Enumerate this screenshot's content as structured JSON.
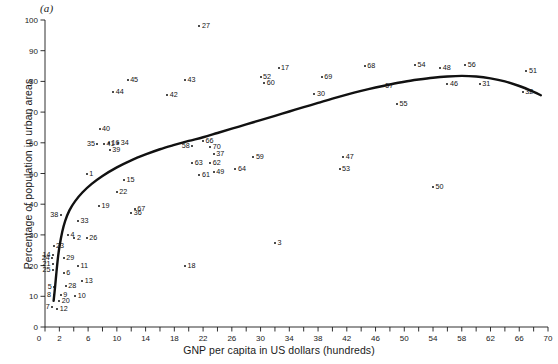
{
  "figure": {
    "panel_label": "(a)",
    "xlabel": "GNP per capita  in US dollars (hundreds)",
    "ylabel": "Percentage of population in urban areas"
  },
  "chart_data": {
    "type": "scatter",
    "title": "",
    "xlabel": "GNP per capita in US dollars (hundreds)",
    "ylabel": "Percentage of population in urban areas",
    "xlim": [
      0,
      70
    ],
    "ylim": [
      0,
      100
    ],
    "xticks": [
      0,
      2,
      6,
      10,
      14,
      18,
      22,
      26,
      30,
      34,
      38,
      42,
      46,
      50,
      54,
      58,
      62,
      66,
      70
    ],
    "xtick_labels": [
      "0",
      "2",
      "6",
      "10",
      "14",
      "18",
      "22",
      "26",
      "30",
      "34",
      "38",
      "42",
      "46",
      "50",
      "54",
      "58",
      "62",
      "66",
      "70"
    ],
    "xtick_minor_step": 2,
    "yticks": [
      0,
      10,
      20,
      30,
      40,
      50,
      60,
      70,
      80,
      90,
      100
    ],
    "ytick_labels": [
      "0",
      "10",
      "20",
      "30",
      "40",
      "50",
      "60",
      "70",
      "80",
      "90",
      "100"
    ],
    "grid": false,
    "legend": null,
    "point_label_position": "right",
    "marker": "dot",
    "marker_color": "#111111",
    "fit_curve": {
      "name": "fitted smooth curve",
      "color": "#111111",
      "width": 2.4,
      "points": [
        [
          1.2,
          8.5
        ],
        [
          1.4,
          13.0
        ],
        [
          1.6,
          18.0
        ],
        [
          1.8,
          22.5
        ],
        [
          2.0,
          26.0
        ],
        [
          2.4,
          31.0
        ],
        [
          2.8,
          34.5
        ],
        [
          3.4,
          38.0
        ],
        [
          4.2,
          41.0
        ],
        [
          5.2,
          43.8
        ],
        [
          6.5,
          46.6
        ],
        [
          8.0,
          49.2
        ],
        [
          10.0,
          52.0
        ],
        [
          12.0,
          54.3
        ],
        [
          14.0,
          56.2
        ],
        [
          16.0,
          57.9
        ],
        [
          18.0,
          59.3
        ],
        [
          20.0,
          60.6
        ],
        [
          22.0,
          61.8
        ],
        [
          24.0,
          63.2
        ],
        [
          26.0,
          64.6
        ],
        [
          28.0,
          66.0
        ],
        [
          30.0,
          67.4
        ],
        [
          32.0,
          68.8
        ],
        [
          34.0,
          70.2
        ],
        [
          36.0,
          71.6
        ],
        [
          38.0,
          73.0
        ],
        [
          40.0,
          74.4
        ],
        [
          42.0,
          75.7
        ],
        [
          44.0,
          76.9
        ],
        [
          46.0,
          78.0
        ],
        [
          48.0,
          79.0
        ],
        [
          50.0,
          79.9
        ],
        [
          52.0,
          80.6
        ],
        [
          54.0,
          81.2
        ],
        [
          56.0,
          81.6
        ],
        [
          58.0,
          81.8
        ],
        [
          60.0,
          81.6
        ],
        [
          62.0,
          81.0
        ],
        [
          64.0,
          80.0
        ],
        [
          66.0,
          78.5
        ],
        [
          68.0,
          76.6
        ],
        [
          69.0,
          75.5
        ]
      ]
    },
    "points": [
      {
        "label": "1",
        "x": 5.8,
        "y": 50.0
      },
      {
        "label": "2",
        "x": 4.1,
        "y": 29.0
      },
      {
        "label": "3",
        "x": 32.0,
        "y": 27.5
      },
      {
        "label": "4",
        "x": 3.2,
        "y": 30.0
      },
      {
        "label": "5",
        "x": 1.3,
        "y": 13.0
      },
      {
        "label": "6",
        "x": 2.6,
        "y": 17.5
      },
      {
        "label": "7",
        "x": 1.0,
        "y": 6.5
      },
      {
        "label": "8",
        "x": 1.2,
        "y": 10.5
      },
      {
        "label": "9",
        "x": 2.2,
        "y": 10.5
      },
      {
        "label": "10",
        "x": 4.2,
        "y": 10.0
      },
      {
        "label": "11",
        "x": 4.6,
        "y": 20.0
      },
      {
        "label": "12",
        "x": 1.7,
        "y": 6.0
      },
      {
        "label": "13",
        "x": 5.2,
        "y": 15.0
      },
      {
        "label": "14",
        "x": 1.1,
        "y": 23.5
      },
      {
        "label": "15",
        "x": 11.0,
        "y": 48.0
      },
      {
        "label": "16",
        "x": 8.9,
        "y": 60.0
      },
      {
        "label": "17",
        "x": 32.5,
        "y": 84.5
      },
      {
        "label": "18",
        "x": 19.5,
        "y": 20.0
      },
      {
        "label": "19",
        "x": 7.5,
        "y": 39.5
      },
      {
        "label": "20",
        "x": 2.0,
        "y": 8.5
      },
      {
        "label": "21",
        "x": 1.1,
        "y": 20.5
      },
      {
        "label": "22",
        "x": 10.0,
        "y": 44.0
      },
      {
        "label": "23",
        "x": 1.2,
        "y": 26.5
      },
      {
        "label": "24",
        "x": 1.0,
        "y": 22.5
      },
      {
        "label": "25",
        "x": 1.1,
        "y": 18.5
      },
      {
        "label": "26",
        "x": 5.8,
        "y": 29.0
      },
      {
        "label": "27",
        "x": 21.5,
        "y": 98.0
      },
      {
        "label": "28",
        "x": 2.9,
        "y": 13.5
      },
      {
        "label": "29",
        "x": 2.6,
        "y": 22.5
      },
      {
        "label": "30",
        "x": 37.5,
        "y": 76.0
      },
      {
        "label": "31",
        "x": 60.5,
        "y": 79.0
      },
      {
        "label": "32",
        "x": 66.5,
        "y": 76.5
      },
      {
        "label": "33",
        "x": 4.6,
        "y": 34.5
      },
      {
        "label": "34",
        "x": 10.2,
        "y": 60.0
      },
      {
        "label": "35",
        "x": 7.3,
        "y": 59.5
      },
      {
        "label": "36",
        "x": 12.0,
        "y": 37.0
      },
      {
        "label": "37",
        "x": 23.5,
        "y": 56.5
      },
      {
        "label": "38",
        "x": 2.2,
        "y": 36.5
      },
      {
        "label": "39",
        "x": 9.0,
        "y": 57.5
      },
      {
        "label": "40",
        "x": 7.6,
        "y": 64.5
      },
      {
        "label": "41",
        "x": 8.2,
        "y": 59.5
      },
      {
        "label": "42",
        "x": 17.0,
        "y": 75.5
      },
      {
        "label": "43",
        "x": 19.5,
        "y": 80.5
      },
      {
        "label": "44",
        "x": 9.5,
        "y": 76.5
      },
      {
        "label": "45",
        "x": 11.5,
        "y": 80.5
      },
      {
        "label": "46",
        "x": 56.0,
        "y": 79.0
      },
      {
        "label": "47",
        "x": 41.5,
        "y": 55.5
      },
      {
        "label": "48",
        "x": 55.0,
        "y": 84.5
      },
      {
        "label": "49",
        "x": 23.5,
        "y": 50.5
      },
      {
        "label": "50",
        "x": 54.0,
        "y": 45.5
      },
      {
        "label": "51",
        "x": 67.0,
        "y": 83.5
      },
      {
        "label": "52",
        "x": 30.0,
        "y": 81.5
      },
      {
        "label": "53",
        "x": 41.0,
        "y": 51.5
      },
      {
        "label": "54",
        "x": 51.5,
        "y": 85.5
      },
      {
        "label": "55",
        "x": 49.0,
        "y": 72.5
      },
      {
        "label": "56",
        "x": 58.5,
        "y": 85.5
      },
      {
        "label": "57",
        "x": 47.0,
        "y": 78.5
      },
      {
        "label": "58",
        "x": 20.5,
        "y": 59.0
      },
      {
        "label": "59",
        "x": 29.0,
        "y": 55.5
      },
      {
        "label": "60",
        "x": 30.5,
        "y": 79.5
      },
      {
        "label": "61",
        "x": 21.5,
        "y": 49.5
      },
      {
        "label": "62",
        "x": 23.0,
        "y": 53.5
      },
      {
        "label": "63",
        "x": 20.5,
        "y": 53.5
      },
      {
        "label": "64",
        "x": 26.5,
        "y": 51.5
      },
      {
        "label": "66",
        "x": 22.0,
        "y": 60.5
      },
      {
        "label": "67",
        "x": 12.5,
        "y": 38.5
      },
      {
        "label": "68",
        "x": 44.5,
        "y": 85.0
      },
      {
        "label": "69",
        "x": 38.5,
        "y": 81.5
      },
      {
        "label": "70",
        "x": 23.0,
        "y": 58.5
      }
    ]
  }
}
